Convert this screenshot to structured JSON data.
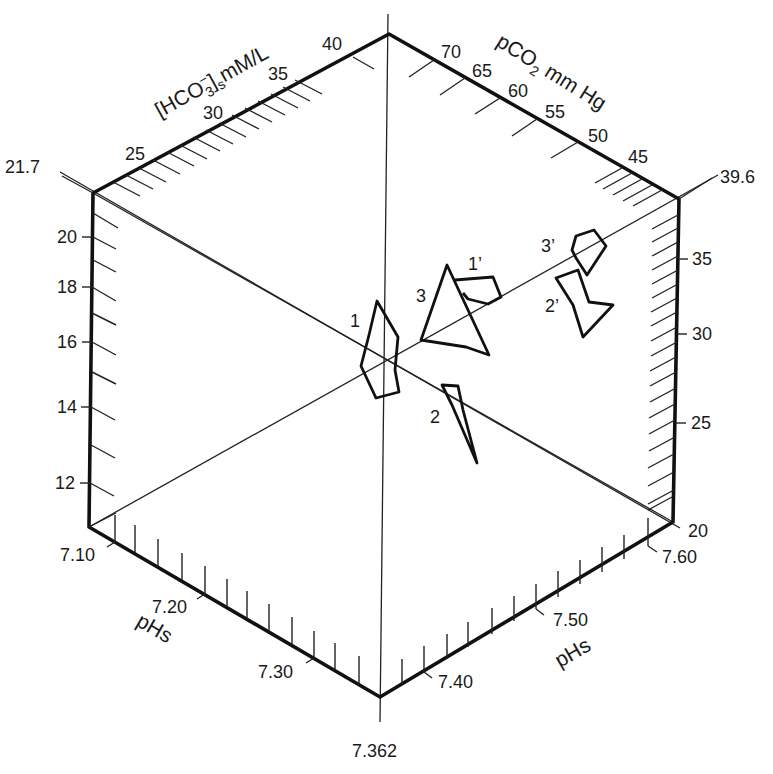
{
  "figure": {
    "axes": {
      "hco3": {
        "title_main": "[HCO",
        "title_sub": "3",
        "title_sup": "−",
        "title_bracket": "]",
        "title_sub2": "s",
        "title_unit": "mM/L",
        "ticks": [
          "25",
          "30",
          "35",
          "40"
        ],
        "corner_value": "21.7"
      },
      "pco2": {
        "title_main": "pCO",
        "title_sub": "2",
        "title_unit": "mm Hg",
        "ticks": [
          "70",
          "65",
          "60",
          "55",
          "50",
          "45"
        ],
        "corner_value": "39.6"
      },
      "left_vertical": {
        "ticks": [
          "20",
          "18",
          "16",
          "14",
          "12"
        ]
      },
      "right_vertical": {
        "ticks": [
          "35",
          "30",
          "25",
          "20"
        ]
      },
      "phs_left": {
        "title": "pHs",
        "ticks": [
          "7.10",
          "7.20",
          "7.30"
        ]
      },
      "phs_right": {
        "title": "pHs",
        "ticks": [
          "7.40",
          "7.50",
          "7.60"
        ]
      },
      "bottom_corner_value": "7.362"
    },
    "regions": [
      {
        "label": "1"
      },
      {
        "label": "1’"
      },
      {
        "label": "2"
      },
      {
        "label": "2’"
      },
      {
        "label": "3"
      },
      {
        "label": "3’"
      }
    ]
  }
}
